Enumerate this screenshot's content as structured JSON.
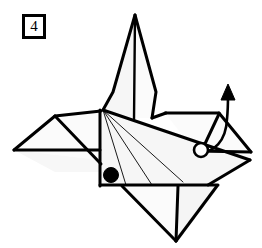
{
  "figure": {
    "step_label": "4",
    "type": "origami-fold-diagram",
    "colors": {
      "ink": "#000000",
      "paper_front": "#fbfbfb",
      "paper_shade": "#f4f4f4",
      "background": "#ffffff"
    },
    "markers": [
      {
        "name": "filled-dot",
        "style": "filled",
        "cx": 111,
        "cy": 175,
        "r": 7.5
      },
      {
        "name": "hollow-circle",
        "style": "hollow",
        "cx": 201,
        "cy": 150,
        "r": 7.5
      }
    ],
    "arrow": {
      "name": "fold-up-arrow",
      "direction": "up",
      "path": "M 200 150 C 214 152 226 140 227 118 C 228 108 228 100 228 94",
      "head": "228,84 222,99 234,99"
    },
    "panels": [
      {
        "name": "head-neck-panel",
        "points": "135,15 156,92 152,118 118,118 111,110 113,92",
        "fill": "paper_front"
      },
      {
        "name": "neck-left-facet",
        "points": "135,15 111,110 103,110 113,92",
        "fill": "paper_shade"
      },
      {
        "name": "head-center-crease",
        "line": "135,15 134,120"
      },
      {
        "name": "left-wing-panel",
        "points": "55,116 100,110 100,160 14,150",
        "fill": "paper_front"
      },
      {
        "name": "left-wing-lower-facet",
        "points": "55,116 100,160 80,160 14,150",
        "fill": "paper_shade"
      },
      {
        "name": "right-wing-panel",
        "points": "165,113 218,113 250,152 196,152",
        "fill": "paper_front"
      },
      {
        "name": "body-panel",
        "points": "103,110 250,152 250,160 100,185 100,110",
        "fill": "paper_front"
      },
      {
        "name": "body-lower-facet",
        "points": "103,110 100,185 205,185 250,160",
        "fill": "paper_shade"
      },
      {
        "name": "tail-flap-panel",
        "points": "122,185 175,240 178,185",
        "fill": "paper_front"
      },
      {
        "name": "tail-flap-right-panel",
        "points": "178,185 175,240 215,185",
        "fill": "paper_shade"
      }
    ],
    "crease_lines": [
      {
        "name": "crease-to-lower-left",
        "line": "103,110 126,185"
      },
      {
        "name": "crease-to-lower-mid",
        "line": "103,110 152,185"
      },
      {
        "name": "crease-to-lower-right",
        "line": "103,110 183,182"
      }
    ],
    "edges": [
      {
        "name": "edge-neck-left",
        "line": "135,15 113,92"
      },
      {
        "name": "edge-neck-left-lower",
        "line": "113,92 103,110"
      },
      {
        "name": "edge-neck-right",
        "line": "135,15 156,92"
      },
      {
        "name": "edge-neck-right-lower",
        "line": "156,92 152,118"
      },
      {
        "name": "edge-neck-base-right",
        "line": "152,118 165,113"
      },
      {
        "name": "edge-head-center",
        "line": "135,15 134,120"
      },
      {
        "name": "edge-left-wing-top",
        "line": "55,116 100,111"
      },
      {
        "name": "edge-left-wing-upper-left",
        "line": "14,150 55,116"
      },
      {
        "name": "edge-left-wing-bottom",
        "line": "14,150 100,150"
      },
      {
        "name": "edge-left-wing-diagonal",
        "line": "55,116 100,162"
      },
      {
        "name": "edge-body-left",
        "line": "100,110 100,185"
      },
      {
        "name": "edge-body-bottom",
        "line": "100,185 216,185"
      },
      {
        "name": "edge-body-diagonal",
        "line": "103,110 250,160"
      },
      {
        "name": "edge-right-wing-top",
        "line": "165,113 218,113"
      },
      {
        "name": "edge-right-wing-right",
        "line": "218,113 250,152"
      },
      {
        "name": "edge-right-wing-bottom",
        "line": "196,152 250,152"
      },
      {
        "name": "edge-right-wing-left",
        "line": "218,113 201,150"
      },
      {
        "name": "edge-body-right-lower",
        "line": "201,150 250,160"
      },
      {
        "name": "edge-tail-left",
        "line": "122,185 175,240"
      },
      {
        "name": "edge-tail-right",
        "line": "175,240 178,185"
      },
      {
        "name": "edge-tail-outer",
        "line": "175,240 216,186"
      }
    ]
  }
}
